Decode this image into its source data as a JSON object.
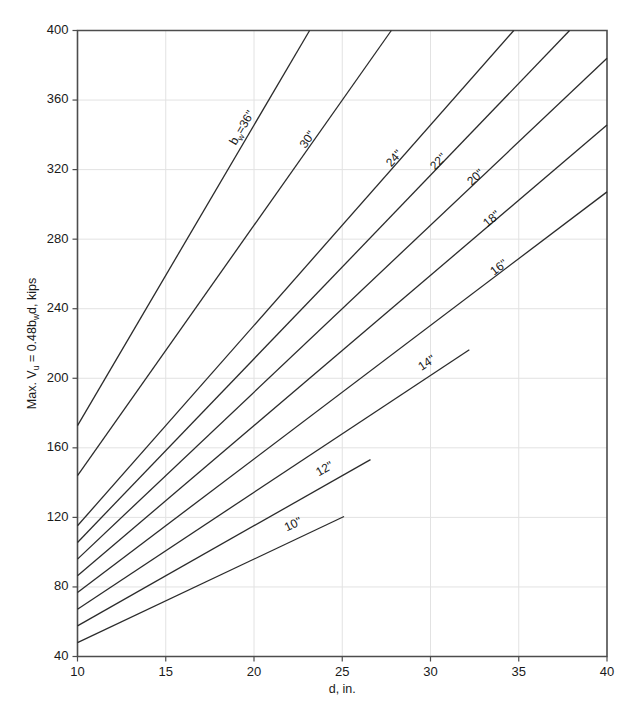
{
  "chart_data": {
    "type": "line",
    "title": "",
    "xlabel": "d, in.",
    "ylabel": "Max. Vᵤ = 0.48bᵥd, kips",
    "ylabel_parts": {
      "prefix": "Max. V",
      "sub1": "u",
      "mid": " = 0.48b",
      "sub2": "w",
      "suffix": "d, kips"
    },
    "xlim": [
      10,
      40
    ],
    "ylim": [
      40,
      400
    ],
    "xticks": [
      10,
      15,
      20,
      25,
      30,
      35,
      40
    ],
    "yticks": [
      40,
      80,
      120,
      160,
      200,
      240,
      280,
      320,
      360,
      400
    ],
    "xticklabels": [
      "10",
      "15",
      "20",
      "25",
      "30",
      "35",
      "40"
    ],
    "yticklabels": [
      "40",
      "80",
      "120",
      "160",
      "200",
      "240",
      "280",
      "320",
      "360",
      "400"
    ],
    "grid": true,
    "grid_color": "#e2e2e2",
    "legend": "none",
    "line_color": "#2b2b2b",
    "axis_color": "#4d4d4d",
    "formula": "V = 0.48 * bw * d",
    "series": [
      {
        "name": "bw=36\"",
        "label": "bᵥ=36\"",
        "label_prefix": "b",
        "label_sub": "w",
        "label_suffix": "=36\"",
        "bw": 36,
        "x": [
          10,
          23.15
        ],
        "y": [
          172.8,
          400
        ],
        "label_at_x": 19.5,
        "label_at_y": 343
      },
      {
        "name": "30\"",
        "label": "30\"",
        "bw": 30,
        "x": [
          10,
          27.78
        ],
        "y": [
          144,
          400
        ],
        "label_at_x": 23.2,
        "label_at_y": 336
      },
      {
        "name": "24\"",
        "label": "24\"",
        "bw": 24,
        "x": [
          10,
          34.72
        ],
        "y": [
          115.2,
          400
        ],
        "label_at_x": 28.1,
        "label_at_y": 325
      },
      {
        "name": "22\"",
        "label": "22\"",
        "bw": 22,
        "x": [
          10,
          37.88
        ],
        "y": [
          105.6,
          400
        ],
        "label_at_x": 30.6,
        "label_at_y": 323
      },
      {
        "name": "20\"",
        "label": "20\"",
        "bw": 20,
        "x": [
          10,
          40
        ],
        "y": [
          96,
          384
        ],
        "label_at_x": 32.7,
        "label_at_y": 314
      },
      {
        "name": "18\"",
        "label": "18\"",
        "bw": 18,
        "x": [
          10,
          40
        ],
        "y": [
          86.4,
          345.6
        ],
        "label_at_x": 33.6,
        "label_at_y": 290
      },
      {
        "name": "16\"",
        "label": "16\"",
        "bw": 16,
        "x": [
          10,
          40
        ],
        "y": [
          76.8,
          307.2
        ],
        "label_at_x": 34.0,
        "label_at_y": 262
      },
      {
        "name": "14\"",
        "label": "14\"",
        "bw": 14,
        "x": [
          10,
          32.2
        ],
        "y": [
          67.2,
          216.4
        ],
        "label_at_x": 29.9,
        "label_at_y": 207
      },
      {
        "name": "12\"",
        "label": "12\"",
        "bw": 12,
        "x": [
          10,
          26.6
        ],
        "y": [
          57.6,
          153.2
        ],
        "label_at_x": 24.1,
        "label_at_y": 146
      },
      {
        "name": "10\"",
        "label": "10\"",
        "bw": 10,
        "x": [
          10,
          25.1
        ],
        "y": [
          48,
          120.5
        ],
        "label_at_x": 22.3,
        "label_at_y": 114
      }
    ]
  }
}
